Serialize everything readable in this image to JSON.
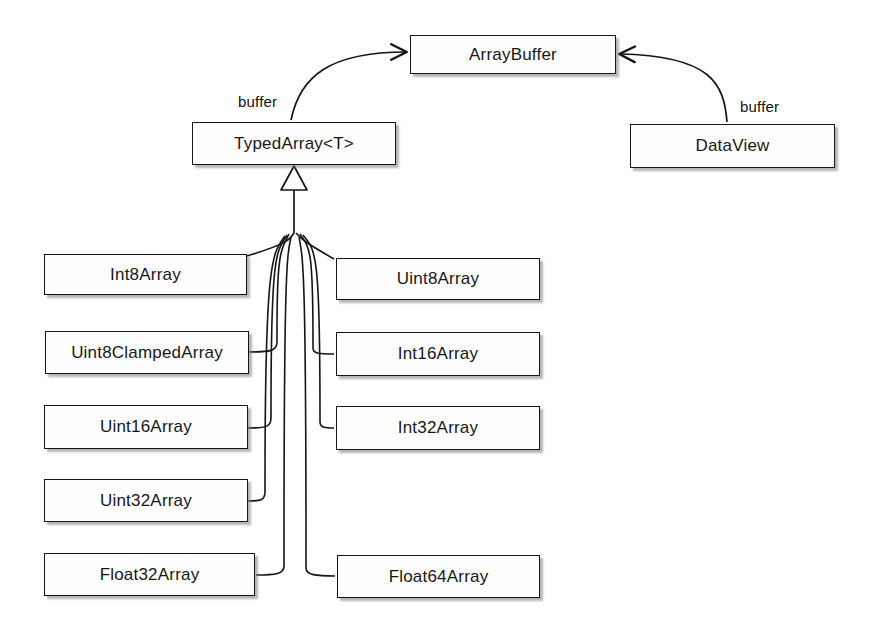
{
  "diagram": {
    "type": "uml-class-diagram",
    "colors": {
      "background": "#ffffff",
      "box_fill": "#fefefe",
      "stroke": "#151515",
      "text": "#171717",
      "shadow": "rgba(120,120,120,0.55)"
    },
    "nodes": {
      "array_buffer": {
        "label": "ArrayBuffer",
        "x": 410,
        "y": 35,
        "w": 206,
        "h": 39
      },
      "typed_array": {
        "label": "TypedArray<T>",
        "x": 192,
        "y": 122,
        "w": 204,
        "h": 43
      },
      "data_view": {
        "label": "DataView",
        "x": 630,
        "y": 124,
        "w": 205,
        "h": 44
      },
      "subclasses": [
        {
          "label": "Int8Array",
          "x": 44,
          "y": 254,
          "w": 203,
          "h": 41,
          "column": "left"
        },
        {
          "label": "Uint8Array",
          "x": 336,
          "y": 258,
          "w": 204,
          "h": 42,
          "column": "right"
        },
        {
          "label": "Uint8ClampedArray",
          "x": 45,
          "y": 331,
          "w": 204,
          "h": 43,
          "column": "left"
        },
        {
          "label": "Int16Array",
          "x": 336,
          "y": 332,
          "w": 204,
          "h": 44,
          "column": "right"
        },
        {
          "label": "Uint16Array",
          "x": 44,
          "y": 405,
          "w": 204,
          "h": 44,
          "column": "left"
        },
        {
          "label": "Int32Array",
          "x": 336,
          "y": 406,
          "w": 204,
          "h": 44,
          "column": "right"
        },
        {
          "label": "Uint32Array",
          "x": 44,
          "y": 479,
          "w": 204,
          "h": 43,
          "column": "left"
        },
        {
          "label": "Float32Array",
          "x": 44,
          "y": 553,
          "w": 211,
          "h": 43,
          "column": "left"
        },
        {
          "label": "Float64Array",
          "x": 337,
          "y": 555,
          "w": 203,
          "h": 43,
          "column": "right"
        }
      ]
    },
    "edges": [
      {
        "name": "typedarray-buffer",
        "from": "TypedArray<T>",
        "to": "ArrayBuffer",
        "label": "buffer",
        "kind": "association-arrow"
      },
      {
        "name": "dataview-buffer",
        "from": "DataView",
        "to": "ArrayBuffer",
        "label": "buffer",
        "kind": "association-arrow"
      },
      {
        "name": "generalization",
        "from": "subclasses",
        "to": "TypedArray<T>",
        "label": "",
        "kind": "inheritance-triangle"
      }
    ],
    "labels": {
      "buffer_left": "buffer",
      "buffer_right": "buffer"
    }
  }
}
